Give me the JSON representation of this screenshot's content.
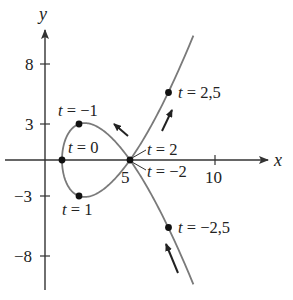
{
  "chart_data": {
    "type": "line",
    "title": "",
    "xlabel": "x",
    "ylabel": "y",
    "parametric": {
      "x": "t^2 + 1",
      "y": "t^3 - 4t",
      "t_range": [
        -2.78,
        2.78
      ]
    },
    "xlim": [
      -2.6,
      14
    ],
    "ylim": [
      -10.8,
      13.3
    ],
    "grid": false,
    "legend": null,
    "x_ticks": [
      {
        "value": 5,
        "label": "5"
      },
      {
        "value": 10,
        "label": "10"
      }
    ],
    "y_ticks": [
      {
        "value": 8,
        "label": "8"
      },
      {
        "value": 3,
        "label": "3"
      },
      {
        "value": -3,
        "label": "−3"
      },
      {
        "value": -8,
        "label": "−8"
      }
    ],
    "marked_points": [
      {
        "t": -1,
        "x": 2,
        "y": 3,
        "label_var": "t",
        "label_val": " = −1"
      },
      {
        "t": 0,
        "x": 1,
        "y": 0,
        "label_var": "t",
        "label_val": " = 0"
      },
      {
        "t": 1,
        "x": 2,
        "y": -3,
        "label_var": "t",
        "label_val": " = 1"
      },
      {
        "t": 2,
        "x": 5,
        "y": 0,
        "label_var": "t",
        "label_val": " = 2"
      },
      {
        "t": -2,
        "x": 5,
        "y": 0,
        "label_var": "t",
        "label_val": " = −2"
      },
      {
        "t": 2.5,
        "x": 7.25,
        "y": 5.625,
        "label_var": "t",
        "label_val": " = 2,5"
      },
      {
        "t": -2.5,
        "x": 7.25,
        "y": -5.625,
        "label_var": "t",
        "label_val": " = −2,5"
      }
    ],
    "direction_arrows": [
      {
        "near_t": 1.6,
        "direction": "up-left"
      },
      {
        "near_t": 2.35,
        "direction": "up-right"
      },
      {
        "near_t": -2.6,
        "direction": "up-left"
      }
    ],
    "colors": {
      "curve": "#7a7a7a",
      "axes": "#333333",
      "points": "#111111",
      "arrows": "#222222"
    }
  },
  "labels": {
    "x_axis": "x",
    "y_axis": "y",
    "tick_8": "8",
    "tick_3": "3",
    "tick_m3": "−3",
    "tick_m8": "−8",
    "tick_5": "5",
    "tick_10": "10",
    "t": "t",
    "eq_m1": " = −1",
    "eq_0": " = 0",
    "eq_1": " = 1",
    "eq_2": " = 2",
    "eq_m2": " = −2",
    "eq_2_5": " = 2,5",
    "eq_m2_5": " = −2,5"
  }
}
